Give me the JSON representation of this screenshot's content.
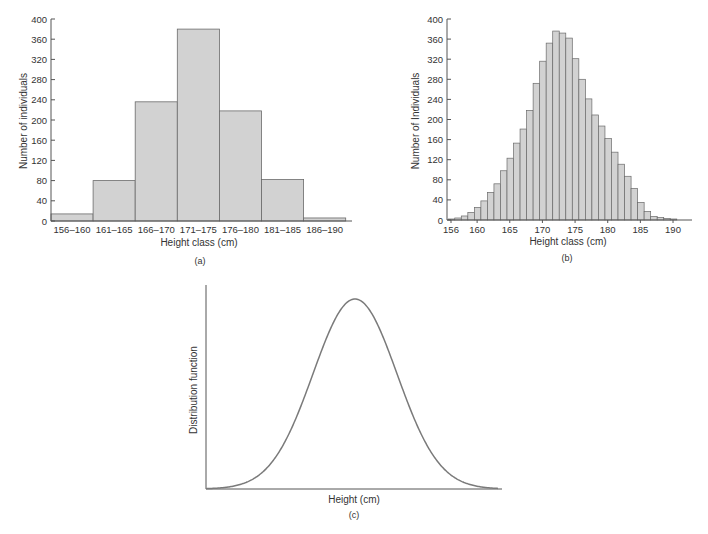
{
  "figure": {
    "panels": [
      "(a)",
      "(b)",
      "(c)"
    ]
  },
  "colors": {
    "bar_fill": "#d2d2d2",
    "bar_stroke": "#6a6a6a",
    "axis": "#555555",
    "curve": "#7a7a7a",
    "text": "#333333"
  },
  "chart_data": [
    {
      "panel": "(a)",
      "type": "bar",
      "title": "",
      "xlabel": "Height class (cm)",
      "ylabel": "Number of individuals",
      "categories": [
        "156–160",
        "161–165",
        "166–170",
        "171–175",
        "176–180",
        "181–185",
        "186–190"
      ],
      "values": [
        14,
        80,
        236,
        380,
        218,
        82,
        6
      ],
      "ylim": [
        0,
        400
      ],
      "yticks": [
        0,
        40,
        80,
        120,
        160,
        200,
        240,
        280,
        320,
        360,
        400
      ],
      "grid": false,
      "caption": "(a)"
    },
    {
      "panel": "(b)",
      "type": "bar",
      "title": "",
      "xlabel": "Height class (cm)",
      "ylabel": "Number of Individuals",
      "x": [
        156,
        157,
        158,
        159,
        160,
        161,
        162,
        163,
        164,
        165,
        166,
        167,
        168,
        169,
        170,
        171,
        172,
        173,
        174,
        175,
        176,
        177,
        178,
        179,
        180,
        181,
        182,
        183,
        184,
        185,
        186,
        187,
        188,
        189,
        190
      ],
      "values": [
        2,
        4,
        8,
        15,
        25,
        38,
        55,
        72,
        98,
        123,
        153,
        181,
        218,
        272,
        316,
        352,
        376,
        372,
        362,
        321,
        280,
        241,
        209,
        187,
        162,
        135,
        111,
        87,
        63,
        35,
        17,
        7,
        5,
        3,
        2
      ],
      "xticks": [
        156,
        160,
        165,
        170,
        175,
        180,
        185,
        190
      ],
      "ylim": [
        0,
        400
      ],
      "yticks": [
        0,
        40,
        80,
        120,
        160,
        200,
        240,
        280,
        320,
        360,
        400
      ],
      "grid": false,
      "caption": "(b)"
    },
    {
      "panel": "(c)",
      "type": "line",
      "title": "",
      "xlabel": "Height (cm)",
      "ylabel": "Distribution function",
      "description": "Smooth bell-shaped (normal) distribution curve, peak near center, no tick labels",
      "mean_fraction": 0.5,
      "grid": false,
      "caption": "(c)"
    }
  ]
}
